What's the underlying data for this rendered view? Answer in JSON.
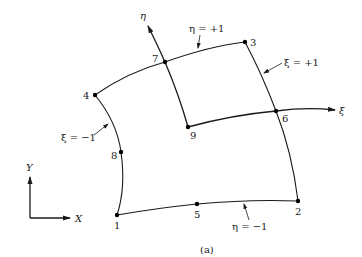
{
  "figure": {
    "caption": "(a)",
    "nodes": [
      {
        "id": "1",
        "label": "1"
      },
      {
        "id": "2",
        "label": "2"
      },
      {
        "id": "3",
        "label": "3"
      },
      {
        "id": "4",
        "label": "4"
      },
      {
        "id": "5",
        "label": "5"
      },
      {
        "id": "6",
        "label": "6"
      },
      {
        "id": "7",
        "label": "7"
      },
      {
        "id": "8",
        "label": "8"
      },
      {
        "id": "9",
        "label": "9"
      }
    ],
    "natural_axes": {
      "eta": "η",
      "xi": "ξ"
    },
    "boundary_labels": {
      "eta_plus": "η = +1",
      "eta_minus": "η = −1",
      "xi_plus": "ξ = +1",
      "xi_minus": "ξ = −1"
    },
    "global_axes": {
      "x": "X",
      "y": "Y"
    }
  }
}
